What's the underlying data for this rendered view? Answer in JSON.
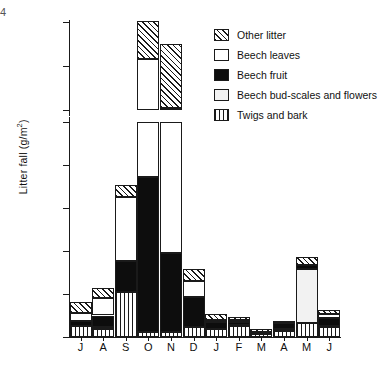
{
  "page_mark": "4",
  "chart_data": {
    "type": "bar",
    "subtype": "stacked",
    "title": "",
    "xlabel": "",
    "ylabel": "Litter fall (g/m2)",
    "ylabel_main": "Litter fall (g/m",
    "ylabel_sup": "2",
    "ylabel_tail": ")",
    "grid": false,
    "legend_position": "top-right",
    "axis_break": true,
    "axis_break_between": [
      100,
      180
    ],
    "ylim_lower": [
      0,
      100
    ],
    "ylim_upper": [
      180,
      220
    ],
    "yticks": [
      0,
      20,
      40,
      60,
      80,
      100,
      180,
      200,
      220
    ],
    "categories": [
      "J",
      "A",
      "S",
      "O",
      "N",
      "D",
      "J",
      "F",
      "M",
      "A",
      "M",
      "J"
    ],
    "category_names": [
      "July",
      "August",
      "September",
      "October",
      "November",
      "December",
      "January",
      "February",
      "March",
      "April",
      "May",
      "June"
    ],
    "series": [
      {
        "name": "Twigs and bark",
        "fill": "vertical-lines",
        "values": [
          5.0,
          3.5,
          21.0,
          2.5,
          2.5,
          4.5,
          3.5,
          5.0,
          1.5,
          3.0,
          6.5,
          4.5
        ]
      },
      {
        "name": "Beech bud-scales and flowers",
        "fill": "light-gray",
        "values": [
          0.0,
          1.0,
          0.0,
          0.0,
          0.0,
          0.0,
          0.0,
          0.5,
          0.5,
          0.5,
          25.0,
          0.5
        ]
      },
      {
        "name": "Beech fruit",
        "fill": "solid-black",
        "values": [
          2.5,
          5.5,
          14.5,
          72.0,
          36.5,
          14.0,
          3.5,
          1.5,
          0.5,
          3.0,
          2.0,
          4.0
        ]
      },
      {
        "name": "Beech leaves",
        "fill": "white",
        "values": [
          3.5,
          8.0,
          29.5,
          128.5,
          142.0,
          7.5,
          1.0,
          1.0,
          0.0,
          0.0,
          0.0,
          1.5
        ]
      },
      {
        "name": "Other litter",
        "fill": "diagonal-hatch",
        "values": [
          5.5,
          5.0,
          5.5,
          17.5,
          29.0,
          5.5,
          2.5,
          1.5,
          1.0,
          1.0,
          3.5,
          2.0
        ]
      }
    ],
    "totals": [
      16.5,
      23.0,
      70.5,
      220.5,
      210.0,
      31.5,
      10.5,
      9.5,
      3.5,
      7.5,
      37.0,
      12.5
    ]
  },
  "legend": {
    "items": [
      {
        "label": "Other litter",
        "swatch": "diagonal-hatch"
      },
      {
        "label": "Beech leaves",
        "swatch": "white"
      },
      {
        "label": "Beech fruit",
        "swatch": "solid-black"
      },
      {
        "label": "Beech bud-scales and flowers",
        "swatch": "light-gray"
      },
      {
        "label": "Twigs and bark",
        "swatch": "vertical-lines"
      }
    ]
  },
  "axis": {
    "y_tick_labels": [
      "220",
      "200",
      "180",
      "100",
      "80",
      "60",
      "40",
      "20",
      "0"
    ],
    "x_tick_labels": [
      "J",
      "A",
      "S",
      "O",
      "N",
      "D",
      "J",
      "F",
      "M",
      "A",
      "M",
      "J"
    ]
  },
  "colors": {
    "ink": "#1a1a1a",
    "paper": "#ffffff",
    "light_gray": "#f2f2f2"
  }
}
